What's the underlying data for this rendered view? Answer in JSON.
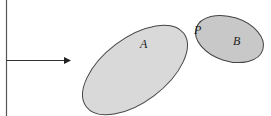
{
  "diagram": {
    "labels": {
      "set_a": "A",
      "set_b": "B",
      "point_p": "P"
    },
    "colors": {
      "set_a_fill": "#d9d9d9",
      "set_b_fill": "#c8c8c8",
      "stroke": "#444444",
      "line": "#333333"
    },
    "arrow_icon": "arrow-right-icon"
  }
}
